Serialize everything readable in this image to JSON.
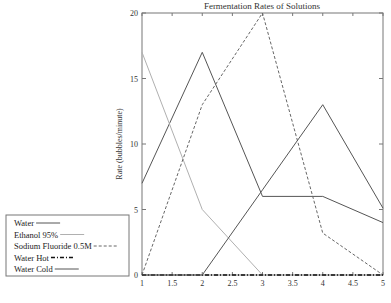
{
  "chart_data": {
    "type": "line",
    "title": "Fermentation Rates of Solutions",
    "xlabel": "",
    "ylabel": "Rate (bubbles/minute)",
    "x": [
      1,
      2,
      3,
      4,
      5
    ],
    "xlim": [
      1,
      5
    ],
    "ylim": [
      0,
      20
    ],
    "xticks": [
      "1",
      "1.5",
      "2",
      "2.5",
      "3",
      "3.5",
      "4",
      "4.5",
      "5"
    ],
    "yticks": [
      "0",
      "5",
      "10",
      "15",
      "20"
    ],
    "grid": false,
    "legend_position": "lower-left-outside",
    "series": [
      {
        "name": "Water",
        "values": [
          7,
          17,
          6,
          6,
          4
        ],
        "color": "#555555",
        "dash": "solid"
      },
      {
        "name": "Ethanol 95%",
        "values": [
          17,
          5,
          0,
          0,
          0
        ],
        "color": "#b0b0b0",
        "dash": "solid"
      },
      {
        "name": "Sodium Fluoride 0.5M",
        "values": [
          0,
          13,
          20,
          3.2,
          0
        ],
        "color": "#666666",
        "dash": "dashed"
      },
      {
        "name": "Water Hot",
        "values": [
          0,
          0,
          0,
          0,
          0
        ],
        "color": "#111111",
        "dash": "dashdot"
      },
      {
        "name": "Water Cold",
        "values": [
          0,
          0,
          6.5,
          13,
          5.1
        ],
        "color": "#555555",
        "dash": "solid"
      }
    ]
  }
}
